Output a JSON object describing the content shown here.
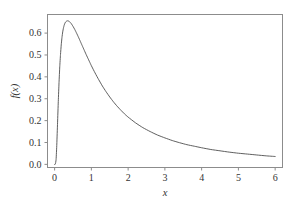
{
  "chart_data": {
    "type": "line",
    "title": "",
    "subtitle": "",
    "xlabel": "x",
    "ylabel": "f(x)",
    "xlim": [
      -0.18,
      6.2
    ],
    "ylim": [
      -0.012,
      0.685
    ],
    "grid": false,
    "legend": null,
    "legend_position": "none",
    "xticks": [
      0,
      1,
      2,
      3,
      4,
      5,
      6
    ],
    "xticklabels": [
      "0",
      "1",
      "2",
      "3",
      "4",
      "5",
      "6"
    ],
    "yticks": [
      0.0,
      0.1,
      0.2,
      0.3,
      0.4,
      0.5,
      0.6
    ],
    "yticklabels": [
      "0.0",
      "0.1",
      "0.2",
      "0.3",
      "0.4",
      "0.5",
      "0.6"
    ],
    "series": [
      {
        "name": "f(x)",
        "color": "#4d4d4d",
        "x": [
          0.0,
          0.02,
          0.04,
          0.06,
          0.08,
          0.1,
          0.12,
          0.14,
          0.16,
          0.18,
          0.2,
          0.22,
          0.24,
          0.26,
          0.28,
          0.3,
          0.32,
          0.34,
          0.36,
          0.38,
          0.4,
          0.45,
          0.5,
          0.55,
          0.6,
          0.65,
          0.7,
          0.75,
          0.8,
          0.85,
          0.9,
          0.95,
          1.0,
          1.1,
          1.2,
          1.3,
          1.4,
          1.5,
          1.6,
          1.7,
          1.8,
          1.9,
          2.0,
          2.2,
          2.4,
          2.6,
          2.8,
          3.0,
          3.2,
          3.4,
          3.6,
          3.8,
          4.0,
          4.25,
          4.5,
          4.75,
          5.0,
          5.25,
          5.5,
          5.75,
          6.0
        ],
        "y": [
          0.0,
          0.001,
          0.022,
          0.093,
          0.19,
          0.288,
          0.374,
          0.446,
          0.502,
          0.546,
          0.58,
          0.605,
          0.623,
          0.636,
          0.645,
          0.651,
          0.654,
          0.656,
          0.656,
          0.655,
          0.653,
          0.644,
          0.631,
          0.616,
          0.599,
          0.581,
          0.562,
          0.543,
          0.524,
          0.505,
          0.487,
          0.469,
          0.451,
          0.418,
          0.387,
          0.358,
          0.332,
          0.308,
          0.286,
          0.266,
          0.248,
          0.231,
          0.216,
          0.19,
          0.168,
          0.15,
          0.134,
          0.121,
          0.109,
          0.099,
          0.09,
          0.083,
          0.076,
          0.068,
          0.062,
          0.056,
          0.051,
          0.047,
          0.043,
          0.039,
          0.036
        ]
      }
    ],
    "annotations": []
  },
  "figure": {
    "background_color": "#ffffff",
    "frame_color": "#8c8c8c",
    "curve_color": "#4d4d4d",
    "tick_color": "#8c8c8c",
    "text_color": "#333333"
  }
}
